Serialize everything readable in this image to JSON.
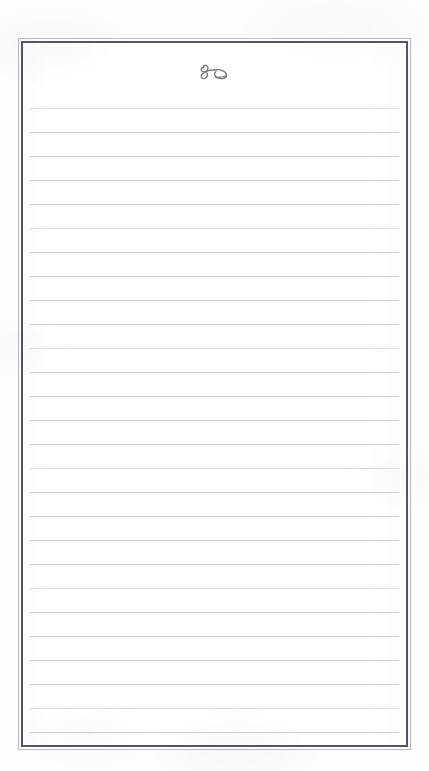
{
  "document": {
    "kind": "scanned-blank-ruled-page",
    "title": "Blank Ruled Notebook Page",
    "paper_color": "#ffffff",
    "scan_margin_color": "#fdfdfd"
  },
  "frame": {
    "name": "double-rule-border",
    "outer_line_color": "#b9bcc0",
    "inner_line_color": "#54585e",
    "outer_line_width_px": 1,
    "inner_line_width_px": 2
  },
  "header": {
    "ornament_name": "hand-drawn-flourish-ornament",
    "ornament_description": "small cursive ink flourish resembling a looped ampersand with a leaf tail",
    "ornament_ink_color": "#4a4d52"
  },
  "ruling": {
    "line_color": "#d0d2d6",
    "line_count": 27,
    "line_spacing_px": 24,
    "first_line_offset_px": 10,
    "content_text": "",
    "content_placeholder": ""
  }
}
